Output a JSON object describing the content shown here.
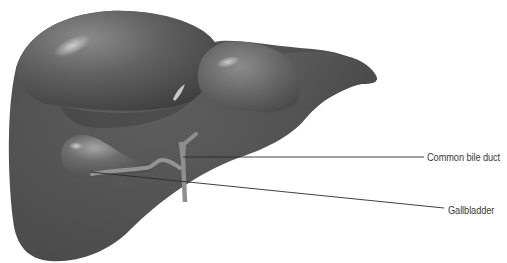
{
  "diagram": {
    "colors": {
      "background": "#ffffff",
      "liver_base": "#5a5a5a",
      "liver_dark": "#3e3e3e",
      "liver_highlight": "#9a9a9a",
      "duct": "#8f8f8f",
      "leader_line": "#2a2a2a",
      "label_text": "#3a3a3a"
    },
    "labels": [
      {
        "id": "common-bile-duct",
        "text": "Common bile duct",
        "leader_from": [
          183,
          157
        ],
        "leader_to": [
          424,
          157
        ]
      },
      {
        "id": "gallbladder",
        "text": "Gallbladder",
        "leader_from": [
          90,
          172
        ],
        "leader_to": [
          444,
          208
        ]
      }
    ]
  }
}
